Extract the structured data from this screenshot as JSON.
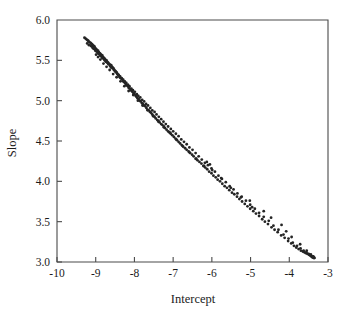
{
  "figure": {
    "background_color": "#ffffff",
    "foreground_color": "#1c1c1c",
    "axis_color": "#4a4a4a",
    "marker_color": "#242424"
  },
  "axes": {
    "x_title": "Intercept",
    "y_title": "Slope",
    "x_tick_labels": [
      "-10",
      "-9",
      "-8",
      "-7",
      "-6",
      "-5",
      "-4",
      "-3"
    ],
    "y_tick_labels": [
      "3.0",
      "3.5",
      "4.0",
      "4.5",
      "5.0",
      "5.5",
      "6.0"
    ]
  },
  "chart_data": {
    "type": "scatter",
    "title": "",
    "subtitle": "",
    "xlabel": "Intercept",
    "ylabel": "Slope",
    "xlim": [
      -10,
      -3
    ],
    "ylim": [
      3.0,
      6.0
    ],
    "xticks": [
      -10,
      -9,
      -8,
      -7,
      -6,
      -5,
      -4,
      -3
    ],
    "yticks": [
      3.0,
      3.5,
      4.0,
      4.5,
      5.0,
      5.5,
      6.0
    ],
    "grid": false,
    "legend": null,
    "marker": "dot",
    "marker_size": 1.7,
    "annotations": [],
    "series": [
      {
        "name": "bootstrap regression coefficients",
        "points": [
          [
            -9.29,
            5.78
          ],
          [
            -9.26,
            5.77
          ],
          [
            -9.24,
            5.76
          ],
          [
            -9.21,
            5.75
          ],
          [
            -9.19,
            5.74
          ],
          [
            -9.17,
            5.73
          ],
          [
            -9.14,
            5.72
          ],
          [
            -9.12,
            5.71
          ],
          [
            -9.1,
            5.7
          ],
          [
            -9.08,
            5.69
          ],
          [
            -9.07,
            5.66
          ],
          [
            -9.05,
            5.68
          ],
          [
            -9.03,
            5.67
          ],
          [
            -9.01,
            5.65
          ],
          [
            -8.99,
            5.64
          ],
          [
            -8.97,
            5.63
          ],
          [
            -8.96,
            5.61
          ],
          [
            -8.94,
            5.62
          ],
          [
            -8.92,
            5.6
          ],
          [
            -8.9,
            5.59
          ],
          [
            -8.88,
            5.58
          ],
          [
            -8.86,
            5.57
          ],
          [
            -8.85,
            5.55
          ],
          [
            -8.83,
            5.56
          ],
          [
            -8.81,
            5.54
          ],
          [
            -8.79,
            5.53
          ],
          [
            -8.77,
            5.52
          ],
          [
            -8.75,
            5.51
          ],
          [
            -8.74,
            5.49
          ],
          [
            -8.72,
            5.5
          ],
          [
            -8.7,
            5.48
          ],
          [
            -8.68,
            5.47
          ],
          [
            -8.66,
            5.46
          ],
          [
            -8.64,
            5.45
          ],
          [
            -8.62,
            5.43
          ],
          [
            -8.6,
            5.44
          ],
          [
            -8.58,
            5.42
          ],
          [
            -8.56,
            5.41
          ],
          [
            -8.54,
            5.4
          ],
          [
            -8.52,
            5.38
          ],
          [
            -8.5,
            5.37
          ],
          [
            -8.48,
            5.36
          ],
          [
            -8.46,
            5.35
          ],
          [
            -8.44,
            5.33
          ],
          [
            -8.42,
            5.32
          ],
          [
            -8.4,
            5.31
          ],
          [
            -8.38,
            5.29
          ],
          [
            -8.36,
            5.28
          ],
          [
            -8.33,
            5.27
          ],
          [
            -8.31,
            5.26
          ],
          [
            -8.29,
            5.24
          ],
          [
            -8.27,
            5.23
          ],
          [
            -8.24,
            5.22
          ],
          [
            -8.22,
            5.2
          ],
          [
            -8.2,
            5.19
          ],
          [
            -8.17,
            5.18
          ],
          [
            -8.15,
            5.16
          ],
          [
            -8.12,
            5.15
          ],
          [
            -8.1,
            5.13
          ],
          [
            -8.07,
            5.12
          ],
          [
            -8.05,
            5.11
          ],
          [
            -8.02,
            5.09
          ],
          [
            -8.0,
            5.08
          ],
          [
            -7.97,
            5.06
          ],
          [
            -7.95,
            5.05
          ],
          [
            -7.92,
            5.03
          ],
          [
            -7.89,
            5.02
          ],
          [
            -7.86,
            5.0
          ],
          [
            -7.84,
            4.99
          ],
          [
            -7.81,
            4.97
          ],
          [
            -7.78,
            4.96
          ],
          [
            -7.75,
            4.94
          ],
          [
            -7.72,
            4.93
          ],
          [
            -7.69,
            4.91
          ],
          [
            -7.66,
            4.89
          ],
          [
            -7.63,
            4.88
          ],
          [
            -7.6,
            4.86
          ],
          [
            -7.57,
            4.85
          ],
          [
            -7.54,
            4.83
          ],
          [
            -7.51,
            4.81
          ],
          [
            -7.48,
            4.8
          ],
          [
            -7.45,
            4.78
          ],
          [
            -7.41,
            4.76
          ],
          [
            -7.38,
            4.75
          ],
          [
            -7.35,
            4.73
          ],
          [
            -7.31,
            4.71
          ],
          [
            -7.28,
            4.7
          ],
          [
            -7.24,
            4.68
          ],
          [
            -7.21,
            4.66
          ],
          [
            -7.17,
            4.64
          ],
          [
            -7.13,
            4.62
          ],
          [
            -7.1,
            4.61
          ],
          [
            -7.06,
            4.59
          ],
          [
            -7.02,
            4.57
          ],
          [
            -6.98,
            4.55
          ],
          [
            -6.94,
            4.53
          ],
          [
            -6.9,
            4.51
          ],
          [
            -6.86,
            4.49
          ],
          [
            -6.82,
            4.47
          ],
          [
            -6.78,
            4.45
          ],
          [
            -6.74,
            4.43
          ],
          [
            -6.69,
            4.41
          ],
          [
            -6.65,
            4.39
          ],
          [
            -6.6,
            4.37
          ],
          [
            -6.56,
            4.35
          ],
          [
            -6.51,
            4.33
          ],
          [
            -6.47,
            4.31
          ],
          [
            -6.42,
            4.28
          ],
          [
            -6.37,
            4.26
          ],
          [
            -6.32,
            4.24
          ],
          [
            -6.27,
            4.22
          ],
          [
            -6.22,
            4.19
          ],
          [
            -6.17,
            4.17
          ],
          [
            -6.12,
            4.15
          ],
          [
            -6.07,
            4.12
          ],
          [
            -6.01,
            4.1
          ],
          [
            -5.96,
            4.07
          ],
          [
            -5.9,
            4.05
          ],
          [
            -5.85,
            4.02
          ],
          [
            -5.79,
            4.0
          ],
          [
            -5.73,
            3.97
          ],
          [
            -5.67,
            3.94
          ],
          [
            -5.61,
            3.92
          ],
          [
            -5.55,
            3.89
          ],
          [
            -5.48,
            3.86
          ],
          [
            -5.42,
            3.84
          ],
          [
            -5.35,
            3.81
          ],
          [
            -5.29,
            3.78
          ],
          [
            -5.22,
            3.75
          ],
          [
            -5.15,
            3.72
          ],
          [
            -5.08,
            3.69
          ],
          [
            -5.01,
            3.66
          ],
          [
            -4.93,
            3.63
          ],
          [
            -4.86,
            3.6
          ],
          [
            -4.78,
            3.57
          ],
          [
            -4.7,
            3.53
          ],
          [
            -4.63,
            3.5
          ],
          [
            -4.55,
            3.47
          ],
          [
            -4.46,
            3.43
          ],
          [
            -4.38,
            3.4
          ],
          [
            -4.3,
            3.37
          ],
          [
            -4.21,
            3.33
          ],
          [
            -4.12,
            3.3
          ],
          [
            -4.03,
            3.26
          ],
          [
            -3.95,
            3.23
          ],
          [
            -3.88,
            3.2
          ],
          [
            -3.82,
            3.18
          ],
          [
            -3.76,
            3.16
          ],
          [
            -3.7,
            3.14
          ],
          [
            -3.65,
            3.13
          ],
          [
            -3.61,
            3.12
          ],
          [
            -3.57,
            3.11
          ],
          [
            -3.53,
            3.1
          ],
          [
            -3.49,
            3.09
          ],
          [
            -3.46,
            3.08
          ],
          [
            -3.43,
            3.07
          ],
          [
            -3.41,
            3.06
          ],
          [
            -3.39,
            3.06
          ],
          [
            -3.37,
            3.05
          ],
          [
            -3.35,
            3.05
          ]
        ]
      },
      {
        "name": "secondary strand",
        "points": [
          [
            -9.13,
            5.68
          ],
          [
            -9.1,
            5.67
          ],
          [
            -9.07,
            5.65
          ],
          [
            -9.04,
            5.64
          ],
          [
            -9.01,
            5.62
          ],
          [
            -8.98,
            5.61
          ],
          [
            -8.95,
            5.59
          ],
          [
            -8.92,
            5.58
          ],
          [
            -8.89,
            5.56
          ],
          [
            -8.86,
            5.55
          ],
          [
            -8.83,
            5.53
          ],
          [
            -8.8,
            5.52
          ],
          [
            -8.77,
            5.5
          ],
          [
            -8.73,
            5.48
          ],
          [
            -8.7,
            5.47
          ],
          [
            -8.67,
            5.45
          ],
          [
            -8.63,
            5.43
          ],
          [
            -8.6,
            5.41
          ],
          [
            -8.56,
            5.4
          ],
          [
            -8.53,
            5.38
          ],
          [
            -8.49,
            5.36
          ],
          [
            -8.45,
            5.34
          ],
          [
            -8.41,
            5.32
          ],
          [
            -8.37,
            5.3
          ],
          [
            -8.33,
            5.28
          ],
          [
            -8.29,
            5.26
          ],
          [
            -8.25,
            5.24
          ],
          [
            -8.21,
            5.22
          ],
          [
            -8.17,
            5.2
          ],
          [
            -8.13,
            5.18
          ],
          [
            -8.08,
            5.15
          ],
          [
            -8.04,
            5.13
          ],
          [
            -7.99,
            5.11
          ],
          [
            -7.94,
            5.08
          ],
          [
            -7.9,
            5.06
          ],
          [
            -7.85,
            5.04
          ],
          [
            -7.8,
            5.01
          ],
          [
            -7.75,
            4.99
          ],
          [
            -7.7,
            4.96
          ],
          [
            -7.65,
            4.94
          ],
          [
            -7.59,
            4.91
          ],
          [
            -7.54,
            4.88
          ],
          [
            -7.48,
            4.86
          ],
          [
            -7.43,
            4.83
          ],
          [
            -7.37,
            4.8
          ],
          [
            -7.31,
            4.77
          ],
          [
            -7.25,
            4.74
          ],
          [
            -7.19,
            4.71
          ],
          [
            -7.13,
            4.68
          ],
          [
            -7.06,
            4.65
          ],
          [
            -7.0,
            4.62
          ],
          [
            -6.93,
            4.59
          ],
          [
            -6.86,
            4.56
          ],
          [
            -6.79,
            4.52
          ],
          [
            -6.72,
            4.49
          ],
          [
            -6.65,
            4.46
          ],
          [
            -6.58,
            4.42
          ],
          [
            -6.5,
            4.39
          ],
          [
            -6.42,
            4.35
          ],
          [
            -6.34,
            4.31
          ],
          [
            -6.26,
            4.27
          ],
          [
            -6.18,
            4.23
          ],
          [
            -6.1,
            4.2
          ],
          [
            -6.01,
            4.16
          ],
          [
            -5.92,
            4.12
          ],
          [
            -5.83,
            4.07
          ],
          [
            -5.74,
            4.03
          ],
          [
            -5.64,
            3.99
          ],
          [
            -5.54,
            3.94
          ],
          [
            -5.44,
            3.9
          ],
          [
            -5.34,
            3.85
          ],
          [
            -5.23,
            3.81
          ],
          [
            -5.12,
            3.76
          ],
          [
            -5.01,
            3.71
          ],
          [
            -4.89,
            3.66
          ],
          [
            -4.78,
            3.61
          ],
          [
            -4.66,
            3.56
          ],
          [
            -4.53,
            3.51
          ],
          [
            -4.41,
            3.45
          ],
          [
            -4.28,
            3.4
          ],
          [
            -4.15,
            3.34
          ],
          [
            -4.02,
            3.29
          ],
          [
            -3.91,
            3.24
          ],
          [
            -3.8,
            3.2
          ],
          [
            -3.71,
            3.17
          ],
          [
            -3.63,
            3.14
          ],
          [
            -3.56,
            3.12
          ],
          [
            -3.5,
            3.1
          ],
          [
            -3.45,
            3.09
          ],
          [
            -3.41,
            3.07
          ],
          [
            -3.38,
            3.06
          ],
          [
            -3.36,
            3.05
          ]
        ]
      },
      {
        "name": "scattered outliers",
        "points": [
          [
            -9.22,
            5.71
          ],
          [
            -9.18,
            5.69
          ],
          [
            -8.99,
            5.57
          ],
          [
            -8.94,
            5.54
          ],
          [
            -8.88,
            5.51
          ],
          [
            -8.8,
            5.46
          ],
          [
            -8.72,
            5.42
          ],
          [
            -8.64,
            5.38
          ],
          [
            -8.55,
            5.33
          ],
          [
            -8.46,
            5.29
          ],
          [
            -8.36,
            5.24
          ],
          [
            -8.26,
            5.18
          ],
          [
            -8.15,
            5.12
          ],
          [
            -8.03,
            5.07
          ],
          [
            -7.91,
            5.0
          ],
          [
            -7.79,
            4.94
          ],
          [
            -7.66,
            4.88
          ],
          [
            -7.52,
            4.81
          ],
          [
            -7.38,
            4.74
          ],
          [
            -7.24,
            4.67
          ],
          [
            -7.08,
            4.6
          ],
          [
            -6.92,
            4.52
          ],
          [
            -6.76,
            4.44
          ],
          [
            -6.58,
            4.36
          ],
          [
            -6.4,
            4.28
          ],
          [
            -6.2,
            4.19
          ],
          [
            -6.13,
            4.24
          ],
          [
            -6.05,
            4.21
          ],
          [
            -5.99,
            4.14
          ],
          [
            -5.76,
            4.04
          ],
          [
            -5.51,
            3.92
          ],
          [
            -5.25,
            3.8
          ],
          [
            -5.02,
            3.76
          ],
          [
            -4.96,
            3.68
          ],
          [
            -4.66,
            3.63
          ],
          [
            -4.47,
            3.55
          ],
          [
            -4.2,
            3.46
          ],
          [
            -4.08,
            3.38
          ],
          [
            -3.94,
            3.31
          ],
          [
            -3.72,
            3.22
          ],
          [
            -3.55,
            3.14
          ],
          [
            -3.44,
            3.09
          ],
          [
            -3.38,
            3.07
          ]
        ]
      }
    ]
  }
}
